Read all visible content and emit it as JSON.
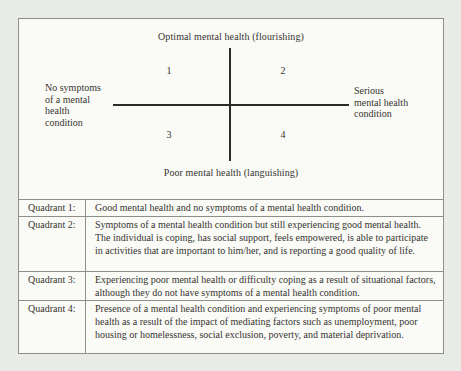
{
  "diagram": {
    "top_axis_label": "Optimal mental health (flourishing)",
    "bottom_axis_label": "Poor mental health (languishing)",
    "left_axis_label": "No symptoms\nof a mental\nhealth\ncondition",
    "right_axis_label": "Serious\nmental health\ncondition",
    "quadrant_numbers": [
      "1",
      "2",
      "3",
      "4"
    ]
  },
  "table": {
    "rows": [
      {
        "label": "Quadrant 1:",
        "description": "Good mental health and no symptoms of a mental health condition."
      },
      {
        "label": "Quadrant 2:",
        "description": "Symptoms of a mental health condition but still experiencing good mental health. The individual is coping, has social support, feels empowered, is able to participate in activities that are important to him/her, and is reporting a good quality of life."
      },
      {
        "label": "Quadrant 3:",
        "description": "Experiencing poor mental health or difficulty coping as a result of situational factors, although they do not have symptoms of a mental health condition."
      },
      {
        "label": "Quadrant 4:",
        "description": "Presence of a mental health condition and experiencing symptoms of poor mental health as a result of the impact of mediating factors such as unemployment, poor housing or homelessness, social exclusion, poverty, and material deprivation."
      }
    ]
  },
  "colors": {
    "page-bg": "#e9ebe6",
    "box-bg": "#fafaf7",
    "line": "#8f8f8a",
    "text": "#37352f",
    "axis": "#2c2b28"
  }
}
